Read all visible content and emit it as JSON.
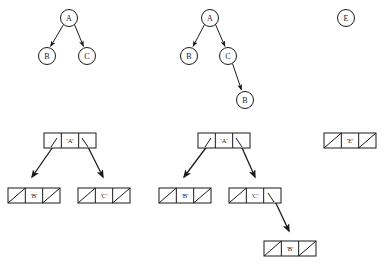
{
  "figure": {
    "background_color": "#ffffff",
    "ink_color": "#1a1a1a",
    "width": 385,
    "height": 265,
    "trees": [
      {
        "id": "tree-left",
        "nodes": [
          {
            "id": "t1-a",
            "label": "A",
            "x": 69,
            "y": 18,
            "r": 8.5
          },
          {
            "id": "t1-b",
            "label": "B",
            "x": 47,
            "y": 56,
            "r": 8.5
          },
          {
            "id": "t1-c",
            "label": "C",
            "x": 87,
            "y": 56,
            "r": 8.5
          }
        ],
        "edges": [
          {
            "from": "t1-a",
            "to": "t1-b"
          },
          {
            "from": "t1-a",
            "to": "t1-c"
          }
        ]
      },
      {
        "id": "tree-middle",
        "nodes": [
          {
            "id": "t2-a",
            "label": "A",
            "x": 210,
            "y": 18,
            "r": 8.5
          },
          {
            "id": "t2-b",
            "label": "B",
            "x": 189,
            "y": 56,
            "r": 8.5
          },
          {
            "id": "t2-c",
            "label": "C",
            "x": 228,
            "y": 56,
            "r": 8.5
          },
          {
            "id": "t2-b2",
            "label": "B",
            "x": 245,
            "y": 100,
            "r": 8.5
          }
        ],
        "edges": [
          {
            "from": "t2-a",
            "to": "t2-b"
          },
          {
            "from": "t2-a",
            "to": "t2-c"
          },
          {
            "from": "t2-c",
            "to": "t2-b2"
          }
        ]
      },
      {
        "id": "tree-right",
        "nodes": [
          {
            "id": "t3-e",
            "label": "E",
            "x": 346,
            "y": 18,
            "r": 8.5
          }
        ],
        "edges": []
      }
    ],
    "cons_diagrams": [
      {
        "id": "cons-left",
        "cells": [
          {
            "id": "cl-a",
            "label": "'A'",
            "x": 44,
            "y": 133,
            "w": 52,
            "h": 15,
            "left_slot": "pointer",
            "right_slot": "pointer"
          },
          {
            "id": "cl-b",
            "label": "'B'",
            "x": 8,
            "y": 188,
            "w": 52,
            "h": 15,
            "left_slot": "nil",
            "right_slot": "nil"
          },
          {
            "id": "cl-c",
            "label": "'C'",
            "x": 78,
            "y": 188,
            "w": 52,
            "h": 15,
            "left_slot": "nil",
            "right_slot": "nil"
          }
        ],
        "arrows": [
          {
            "from": "cl-a",
            "slot": "left",
            "to": "cl-b"
          },
          {
            "from": "cl-a",
            "slot": "right",
            "to": "cl-c"
          }
        ]
      },
      {
        "id": "cons-middle",
        "cells": [
          {
            "id": "cm-a",
            "label": "'A'",
            "x": 198,
            "y": 133,
            "w": 52,
            "h": 15,
            "left_slot": "pointer",
            "right_slot": "pointer"
          },
          {
            "id": "cm-b",
            "label": "'B'",
            "x": 159,
            "y": 188,
            "w": 52,
            "h": 15,
            "left_slot": "nil",
            "right_slot": "nil"
          },
          {
            "id": "cm-c",
            "label": "'C'",
            "x": 229,
            "y": 188,
            "w": 52,
            "h": 15,
            "left_slot": "nil",
            "right_slot": "pointer"
          },
          {
            "id": "cm-b2",
            "label": "'B'",
            "x": 264,
            "y": 241,
            "w": 52,
            "h": 15,
            "left_slot": "nil",
            "right_slot": "nil"
          }
        ],
        "arrows": [
          {
            "from": "cm-a",
            "slot": "left",
            "to": "cm-b"
          },
          {
            "from": "cm-a",
            "slot": "right",
            "to": "cm-c"
          },
          {
            "from": "cm-c",
            "slot": "right",
            "to": "cm-b2"
          }
        ]
      },
      {
        "id": "cons-right",
        "cells": [
          {
            "id": "cr-e",
            "label": "'E'",
            "x": 324,
            "y": 133,
            "w": 52,
            "h": 15,
            "left_slot": "nil",
            "right_slot": "nil"
          }
        ],
        "arrows": []
      }
    ]
  }
}
